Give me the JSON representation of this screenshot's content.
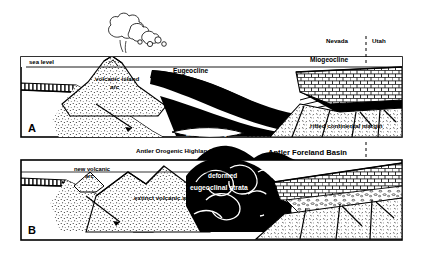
{
  "figure": {
    "title_visible": false,
    "colors": {
      "ink": "#000000",
      "paper": "#ffffff",
      "white_label": "#ffffff"
    },
    "panels": [
      {
        "id": "A",
        "letter": "A",
        "labels": {
          "sea_level": "sea level",
          "volcanic_island_arc_line1": "volcanic island",
          "volcanic_island_arc_line2": "arc",
          "eugeocline": "Eugeocline",
          "miogeocline": "Miogeocline",
          "back_arc_rifting": "Back-arc rifting",
          "rifted_continental_margin": "rifted continental margin",
          "state_left": "Nevada",
          "state_right": "Utah"
        }
      },
      {
        "id": "B",
        "letter": "B",
        "labels": {
          "antler_orogenic_highland": "Antler Orogenic Highland",
          "antler_foreland_basin": "Antler Foreland Basin",
          "new_volcanic_arc_line1": "new volcanic",
          "new_volcanic_arc_line2": "arc",
          "extinct_volcanic_arc": "extinct volcanic arc",
          "deformed_line1": "deformed",
          "deformed_line2": "eugeoclinal strata"
        }
      }
    ]
  }
}
